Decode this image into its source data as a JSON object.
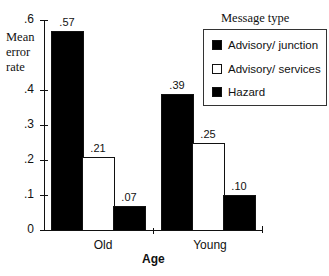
{
  "chart_data": {
    "type": "bar",
    "title": "",
    "xlabel": "Age",
    "ylabel": "Mean error rate",
    "ylim": [
      0,
      0.6
    ],
    "yticks": [
      "0",
      ".1",
      ".2",
      ".3",
      ".4",
      ".6"
    ],
    "categories": [
      "Old",
      "Young"
    ],
    "legend_title": "Message type",
    "legend_position": "top-right",
    "grid": false,
    "series": [
      {
        "name": "Advisory/ junction",
        "color": "#000000",
        "values": [
          0.57,
          0.39
        ],
        "labels": [
          ".57",
          ".39"
        ]
      },
      {
        "name": "Advisory/ services",
        "color": "#ffffff",
        "values": [
          0.21,
          0.25
        ],
        "labels": [
          ".21",
          ".25"
        ]
      },
      {
        "name": "Hazard",
        "color": "#000000",
        "values": [
          0.07,
          0.1
        ],
        "labels": [
          ".07",
          ".10"
        ]
      }
    ]
  },
  "axis": {
    "ylabel_lines": [
      "Mean",
      "error",
      "rate"
    ],
    "xlabel": "Age",
    "ticks": [
      {
        "label": ".6",
        "value": 0.6
      },
      {
        "label": ".4",
        "value": 0.4
      },
      {
        "label": ".3",
        "value": 0.3
      },
      {
        "label": ".2",
        "value": 0.2
      },
      {
        "label": ".1",
        "value": 0.1
      },
      {
        "label": "0",
        "value": 0
      }
    ]
  },
  "legend": {
    "title": "Message type",
    "items": [
      {
        "label": "Advisory/ junction",
        "fill": "#000000"
      },
      {
        "label": "Advisory/ services",
        "fill": "#ffffff"
      },
      {
        "label": "Hazard",
        "fill": "#000000"
      }
    ]
  },
  "groups": [
    {
      "label": "Old",
      "bars": [
        ".57",
        ".21",
        ".07"
      ]
    },
    {
      "label": "Young",
      "bars": [
        ".39",
        ".25",
        ".10"
      ]
    }
  ]
}
